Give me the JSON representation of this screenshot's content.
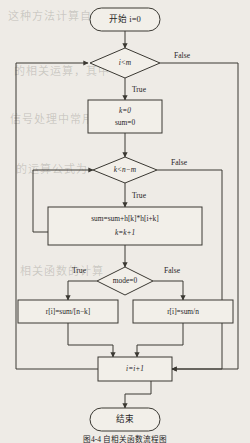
{
  "figure": {
    "type": "flowchart",
    "caption": "图4-4 自相关函数流程图",
    "background_color": "#eeebe6",
    "line_color": "#3a3832",
    "node_fill": "#f2efe9"
  },
  "nodes": {
    "start": {
      "shape": "terminal",
      "text": "开始 i=0"
    },
    "decision_i": {
      "shape": "decision",
      "text": "i<m"
    },
    "init_box": {
      "shape": "process",
      "line1": "k=0",
      "line2": "sum=0"
    },
    "decision_k": {
      "shape": "decision",
      "text": "k<n−m"
    },
    "accum_box": {
      "shape": "process",
      "line1": "sum=sum+h[k]*h[i+k]",
      "line2": "k=k+1"
    },
    "decision_mode": {
      "shape": "decision",
      "text": "mode=0"
    },
    "result_left": {
      "shape": "process",
      "text": "r[i]=sum/[n−k]"
    },
    "result_right": {
      "shape": "process",
      "text": "r[i]=sum/n"
    },
    "increment": {
      "shape": "process",
      "text": "i=i+1"
    },
    "end": {
      "shape": "terminal",
      "text": "结束"
    }
  },
  "edge_labels": {
    "i_false": "False",
    "i_true": "True",
    "k_false": "False",
    "k_true": "True",
    "mode_true": "True",
    "mode_false": "False"
  },
  "ghost_text": {
    "line1": "这种方法计算自相关函数",
    "line2": "的相关运算，其中",
    "line3": "信号处理中常用",
    "line4": "的运算公式为",
    "line5": "相关函数的计算"
  }
}
